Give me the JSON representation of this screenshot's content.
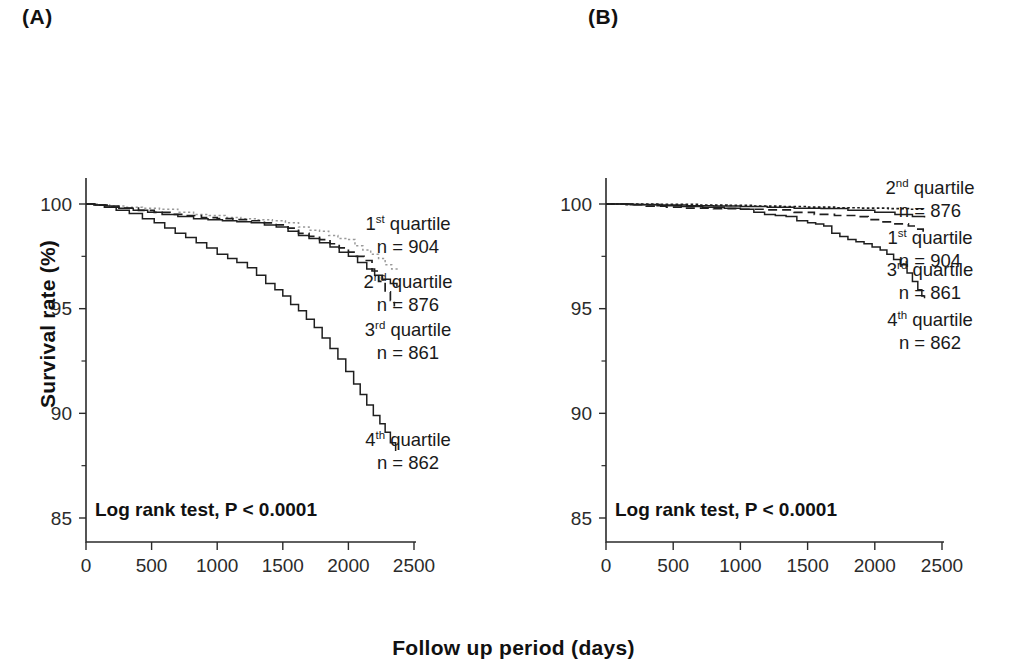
{
  "figure": {
    "x_axis_title": "Follow  up period (days)",
    "y_axis_title": "Survival rate (%)"
  },
  "panels": [
    {
      "id": "A",
      "label": "(A)",
      "annotation": "Log rank test, P < 0.0001",
      "legend": [
        {
          "ordinal": "1",
          "sup": "st",
          "word": " quartile",
          "n": "n = 904"
        },
        {
          "ordinal": "2",
          "sup": "nd",
          "word": " quartile",
          "n": "n = 876"
        },
        {
          "ordinal": "3",
          "sup": "rd",
          "word": " quartile",
          "n": "n = 861"
        },
        {
          "ordinal": "4",
          "sup": "th",
          "word": " quartile",
          "n": "n = 862"
        }
      ]
    },
    {
      "id": "B",
      "label": "(B)",
      "annotation": "Log rank test, P < 0.0001",
      "legend": [
        {
          "ordinal": "2",
          "sup": "nd",
          "word": " quartile",
          "n": "n = 876"
        },
        {
          "ordinal": "1",
          "sup": "st",
          "word": " quartile",
          "n": "n = 904"
        },
        {
          "ordinal": "3",
          "sup": "rd",
          "word": " quartile",
          "n": "n = 861"
        },
        {
          "ordinal": "4",
          "sup": "th",
          "word": " quartile",
          "n": "n = 862"
        }
      ]
    }
  ],
  "chart_data": {
    "type": "line",
    "subtype": "kaplan-meier-step",
    "title": "",
    "xlabel": "Follow  up period (days)",
    "ylabel": "Survival rate (%)",
    "xlim": [
      0,
      2500
    ],
    "ylim": [
      85,
      100
    ],
    "xticks": [
      0,
      500,
      1000,
      1500,
      2000,
      2500
    ],
    "xticklabels": [
      "0",
      "500",
      "1000",
      "1500",
      "2000",
      "2500"
    ],
    "yticks": [
      85,
      90,
      95,
      100
    ],
    "yticklabels": [
      "85",
      "90",
      "95",
      "100"
    ],
    "yminorticks": [
      87.5,
      92.5,
      97.5
    ],
    "grid": false,
    "legend_position": "right-outside",
    "panels": [
      {
        "id": "A",
        "annotation": "Log rank test, P < 0.0001",
        "series": [
          {
            "name": "1st quartile",
            "n": 904,
            "style": "dotted-light",
            "color": "#9a9a9a",
            "points": [
              [
                0,
                100.0
              ],
              [
                90,
                99.95
              ],
              [
                180,
                99.9
              ],
              [
                300,
                99.85
              ],
              [
                430,
                99.8
              ],
              [
                560,
                99.75
              ],
              [
                700,
                99.6
              ],
              [
                820,
                99.5
              ],
              [
                940,
                99.45
              ],
              [
                1060,
                99.35
              ],
              [
                1180,
                99.3
              ],
              [
                1300,
                99.25
              ],
              [
                1420,
                99.2
              ],
              [
                1520,
                99.1
              ],
              [
                1620,
                98.9
              ],
              [
                1700,
                98.75
              ],
              [
                1780,
                98.7
              ],
              [
                1850,
                98.5
              ],
              [
                1920,
                98.35
              ],
              [
                1990,
                98.3
              ],
              [
                2050,
                98.0
              ],
              [
                2110,
                97.8
              ],
              [
                2170,
                97.6
              ],
              [
                2230,
                97.4
              ],
              [
                2280,
                97.1
              ],
              [
                2330,
                96.9
              ],
              [
                2370,
                96.8
              ]
            ]
          },
          {
            "name": "2nd quartile",
            "n": 876,
            "style": "dashed",
            "color": "#1f1f1f",
            "points": [
              [
                0,
                100.0
              ],
              [
                80,
                99.95
              ],
              [
                170,
                99.85
              ],
              [
                280,
                99.8
              ],
              [
                400,
                99.7
              ],
              [
                520,
                99.6
              ],
              [
                640,
                99.5
              ],
              [
                760,
                99.45
              ],
              [
                880,
                99.35
              ],
              [
                1000,
                99.3
              ],
              [
                1120,
                99.25
              ],
              [
                1250,
                99.2
              ],
              [
                1360,
                99.1
              ],
              [
                1450,
                99.0
              ],
              [
                1540,
                98.85
              ],
              [
                1620,
                98.6
              ],
              [
                1700,
                98.45
              ],
              [
                1780,
                98.3
              ],
              [
                1860,
                98.1
              ],
              [
                1930,
                97.9
              ],
              [
                2000,
                97.7
              ],
              [
                2060,
                97.5
              ],
              [
                2120,
                97.3
              ],
              [
                2180,
                96.8
              ],
              [
                2230,
                96.3
              ],
              [
                2280,
                95.8
              ],
              [
                2320,
                95.4
              ],
              [
                2350,
                95.1
              ]
            ]
          },
          {
            "name": "3rd quartile",
            "n": 861,
            "style": "solid",
            "color": "#1f1f1f",
            "points": [
              [
                0,
                100.0
              ],
              [
                70,
                99.95
              ],
              [
                150,
                99.9
              ],
              [
                250,
                99.8
              ],
              [
                360,
                99.7
              ],
              [
                470,
                99.6
              ],
              [
                580,
                99.5
              ],
              [
                700,
                99.4
              ],
              [
                820,
                99.3
              ],
              [
                930,
                99.25
              ],
              [
                1040,
                99.2
              ],
              [
                1150,
                99.15
              ],
              [
                1260,
                99.1
              ],
              [
                1360,
                99.0
              ],
              [
                1450,
                98.9
              ],
              [
                1540,
                98.7
              ],
              [
                1620,
                98.5
              ],
              [
                1700,
                98.35
              ],
              [
                1780,
                98.15
              ],
              [
                1860,
                97.95
              ],
              [
                1930,
                97.7
              ],
              [
                2000,
                97.5
              ],
              [
                2070,
                97.2
              ],
              [
                2140,
                96.9
              ],
              [
                2200,
                96.6
              ],
              [
                2260,
                96.4
              ],
              [
                2320,
                96.2
              ],
              [
                2370,
                96.05
              ]
            ]
          },
          {
            "name": "4th quartile",
            "n": 862,
            "style": "solid",
            "color": "#1f1f1f",
            "points": [
              [
                0,
                100.0
              ],
              [
                60,
                99.95
              ],
              [
                140,
                99.85
              ],
              [
                230,
                99.7
              ],
              [
                330,
                99.55
              ],
              [
                430,
                99.3
              ],
              [
                520,
                99.1
              ],
              [
                600,
                98.85
              ],
              [
                680,
                98.6
              ],
              [
                760,
                98.4
              ],
              [
                840,
                98.15
              ],
              [
                920,
                97.9
              ],
              [
                1000,
                97.6
              ],
              [
                1080,
                97.4
              ],
              [
                1150,
                97.2
              ],
              [
                1230,
                96.95
              ],
              [
                1300,
                96.6
              ],
              [
                1370,
                96.2
              ],
              [
                1440,
                95.9
              ],
              [
                1500,
                95.6
              ],
              [
                1560,
                95.2
              ],
              [
                1620,
                94.9
              ],
              [
                1680,
                94.5
              ],
              [
                1740,
                94.1
              ],
              [
                1800,
                93.6
              ],
              [
                1860,
                93.1
              ],
              [
                1920,
                92.6
              ],
              [
                1980,
                92.0
              ],
              [
                2040,
                91.4
              ],
              [
                2090,
                90.9
              ],
              [
                2140,
                90.4
              ],
              [
                2190,
                89.9
              ],
              [
                2240,
                89.5
              ],
              [
                2280,
                89.1
              ],
              [
                2320,
                88.6
              ],
              [
                2360,
                88.2
              ]
            ]
          }
        ]
      },
      {
        "id": "B",
        "annotation": "Log rank test, P < 0.0001",
        "series": [
          {
            "name": "2nd quartile",
            "n": 876,
            "style": "dense-dotted",
            "color": "#1f1f1f",
            "points": [
              [
                0,
                100.0
              ],
              [
                200,
                100.0
              ],
              [
                400,
                99.98
              ],
              [
                700,
                99.95
              ],
              [
                900,
                99.93
              ],
              [
                1100,
                99.9
              ],
              [
                1300,
                99.88
              ],
              [
                1500,
                99.85
              ],
              [
                1700,
                99.82
              ],
              [
                1900,
                99.8
              ],
              [
                2100,
                99.78
              ],
              [
                2250,
                99.75
              ],
              [
                2370,
                99.72
              ]
            ]
          },
          {
            "name": "1st quartile",
            "n": 904,
            "style": "dashed",
            "color": "#1f1f1f",
            "points": [
              [
                0,
                100.0
              ],
              [
                150,
                99.97
              ],
              [
                300,
                99.9
              ],
              [
                450,
                99.85
              ],
              [
                600,
                99.8
              ],
              [
                800,
                99.78
              ],
              [
                1000,
                99.75
              ],
              [
                1200,
                99.72
              ],
              [
                1400,
                99.6
              ],
              [
                1550,
                99.5
              ],
              [
                1700,
                99.45
              ],
              [
                1850,
                99.4
              ],
              [
                1950,
                99.25
              ],
              [
                2050,
                99.15
              ],
              [
                2150,
                99.05
              ],
              [
                2250,
                98.95
              ],
              [
                2320,
                98.8
              ],
              [
                2360,
                98.6
              ]
            ]
          },
          {
            "name": "3rd quartile",
            "n": 861,
            "style": "solid-thin",
            "color": "#1f1f1f",
            "points": [
              [
                0,
                100.0
              ],
              [
                200,
                99.98
              ],
              [
                400,
                99.95
              ],
              [
                600,
                99.92
              ],
              [
                800,
                99.9
              ],
              [
                1000,
                99.88
              ],
              [
                1200,
                99.85
              ],
              [
                1400,
                99.8
              ],
              [
                1600,
                99.78
              ],
              [
                1800,
                99.7
              ],
              [
                2000,
                99.6
              ],
              [
                2150,
                99.5
              ],
              [
                2280,
                99.4
              ],
              [
                2370,
                99.35
              ]
            ]
          },
          {
            "name": "4th quartile",
            "n": 862,
            "style": "solid",
            "color": "#1f1f1f",
            "points": [
              [
                0,
                100.0
              ],
              [
                180,
                99.97
              ],
              [
                380,
                99.92
              ],
              [
                560,
                99.88
              ],
              [
                720,
                99.85
              ],
              [
                880,
                99.8
              ],
              [
                1000,
                99.75
              ],
              [
                1100,
                99.6
              ],
              [
                1180,
                99.5
              ],
              [
                1260,
                99.45
              ],
              [
                1340,
                99.4
              ],
              [
                1420,
                99.2
              ],
              [
                1500,
                99.1
              ],
              [
                1560,
                99.05
              ],
              [
                1620,
                98.95
              ],
              [
                1680,
                98.6
              ],
              [
                1740,
                98.45
              ],
              [
                1800,
                98.3
              ],
              [
                1860,
                98.2
              ],
              [
                1920,
                98.1
              ],
              [
                1980,
                97.95
              ],
              [
                2040,
                97.8
              ],
              [
                2090,
                97.6
              ],
              [
                2140,
                97.35
              ],
              [
                2190,
                97.1
              ],
              [
                2240,
                96.7
              ],
              [
                2280,
                96.3
              ],
              [
                2320,
                95.9
              ],
              [
                2350,
                95.6
              ],
              [
                2370,
                95.5
              ]
            ]
          }
        ]
      }
    ]
  }
}
